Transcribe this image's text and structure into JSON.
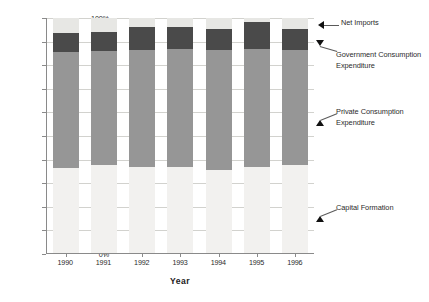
{
  "chart_data": {
    "type": "bar",
    "stacked": true,
    "normalized": true,
    "title": "",
    "xlabel": "Year",
    "ylabel": "",
    "ylim": [
      0,
      100
    ],
    "ytick_labels": [
      "100%",
      "90%",
      "80%",
      "70%",
      "60%",
      "50%",
      "40%",
      "30%",
      "20%",
      "10%",
      "0%"
    ],
    "ytick_values": [
      100,
      90,
      80,
      70,
      60,
      50,
      40,
      30,
      20,
      10,
      0
    ],
    "grid": true,
    "legend_position": "annotations-right",
    "categories": [
      "1990",
      "1991",
      "1992",
      "1993",
      "1994",
      "1995",
      "1996"
    ],
    "series": [
      {
        "name": "Capital Formation",
        "color": "#f2f1ef",
        "values": [
          36,
          37.5,
          36.5,
          36.5,
          35.5,
          36.5,
          37.5
        ]
      },
      {
        "name": "Private Consumption Expenditure",
        "color": "#969696",
        "values": [
          49.5,
          48.5,
          50.0,
          50.5,
          51.0,
          50.5,
          49.0
        ]
      },
      {
        "name": "Government Consumption Expenditure",
        "color": "#4a4a4a",
        "values": [
          8.0,
          8.0,
          9.5,
          9.0,
          9.0,
          11.5,
          9.0
        ]
      },
      {
        "name": "Net Imports",
        "color": "#e7e7e4",
        "values": [
          6.5,
          6.0,
          4.0,
          4.0,
          4.5,
          1.5,
          4.5
        ]
      }
    ]
  },
  "annotations": [
    {
      "label": "Net Imports",
      "arrow": "left"
    },
    {
      "label": "Government Consumption",
      "label2": "Expenditure",
      "arrow": "down"
    },
    {
      "label": "Private Consumption",
      "label2": "Expenditure",
      "arrow": "up"
    },
    {
      "label": "Capital Formation",
      "arrow": "up"
    }
  ]
}
